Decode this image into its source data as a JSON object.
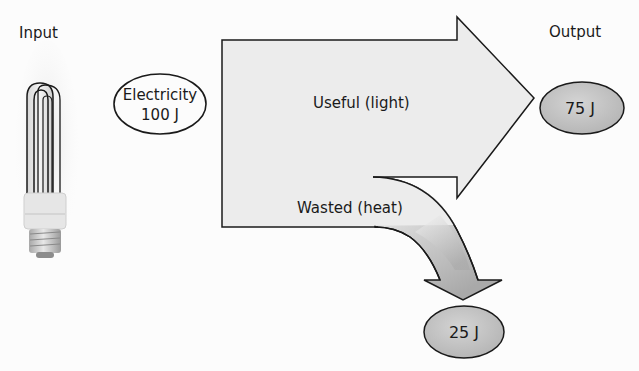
{
  "diagram": {
    "input_label": "Input",
    "output_label": "Output",
    "source": {
      "line1": "Electricity",
      "line2": "100 J"
    },
    "useful": {
      "label": "Useful (light)",
      "value": "75 J"
    },
    "wasted": {
      "label": "Wasted (heat)",
      "value": "25 J"
    },
    "colors": {
      "outline": "#1a1a1a",
      "arrow_fill": "#e9e9e9",
      "output_bubble_fill": "#c8c8c8",
      "background": "#fcfcfc"
    }
  }
}
